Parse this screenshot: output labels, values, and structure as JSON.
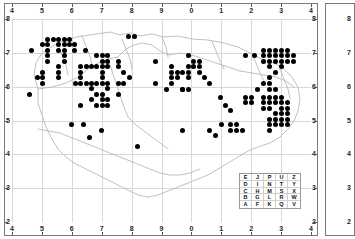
{
  "chart_data": {
    "type": "scatter",
    "title": "",
    "subtitle": "",
    "xlabel": "",
    "ylabel": "",
    "grid": true,
    "legend_position": "bottom-right",
    "axis": {
      "top_ticks": [
        "4",
        "5",
        "6",
        "7",
        "8",
        "9",
        "0",
        "1",
        "2",
        "3",
        "4"
      ],
      "bottom_ticks": [
        "4",
        "5",
        "6",
        "7",
        "8",
        "9",
        "0",
        "1",
        "2",
        "3",
        "4"
      ],
      "left_ticks": [
        "8",
        "7",
        "6",
        "5",
        "4",
        "3",
        "2"
      ],
      "right_ticks": [
        "8",
        "7",
        "6",
        "5",
        "4",
        "3",
        "2"
      ],
      "xlim": [
        40,
        140
      ],
      "ylim": [
        15,
        85
      ]
    },
    "marker": {
      "shape": "filled-circle",
      "color": "#000000",
      "size_px": 5
    },
    "points": [
      [
        52.0,
        78.1
      ],
      [
        53.8,
        78.1
      ],
      [
        55.6,
        78.1
      ],
      [
        57.4,
        78.1
      ],
      [
        59.2,
        78.1
      ],
      [
        50.2,
        76.2
      ],
      [
        52.0,
        76.2
      ],
      [
        55.6,
        76.2
      ],
      [
        57.4,
        76.2
      ],
      [
        59.2,
        76.2
      ],
      [
        61.0,
        76.2
      ],
      [
        46.6,
        74.3
      ],
      [
        52.0,
        74.3
      ],
      [
        55.6,
        74.3
      ],
      [
        57.4,
        74.3
      ],
      [
        61.0,
        74.3
      ],
      [
        64.6,
        74.3
      ],
      [
        52.0,
        72.4
      ],
      [
        57.4,
        72.4
      ],
      [
        52.0,
        70.5
      ],
      [
        57.4,
        70.5
      ],
      [
        55.6,
        68.6
      ],
      [
        50.2,
        66.7
      ],
      [
        55.6,
        66.7
      ],
      [
        48.4,
        64.8
      ],
      [
        50.2,
        64.8
      ],
      [
        55.6,
        64.8
      ],
      [
        50.2,
        62.9
      ],
      [
        79.0,
        79.0
      ],
      [
        81.0,
        79.0
      ],
      [
        68.4,
        72.4
      ],
      [
        70.2,
        72.4
      ],
      [
        72.0,
        72.4
      ],
      [
        70.2,
        70.5
      ],
      [
        72.0,
        70.5
      ],
      [
        75.6,
        70.5
      ],
      [
        63.0,
        68.6
      ],
      [
        64.8,
        68.6
      ],
      [
        66.6,
        68.6
      ],
      [
        68.4,
        68.6
      ],
      [
        70.2,
        68.6
      ],
      [
        72.0,
        68.6
      ],
      [
        75.6,
        68.6
      ],
      [
        63.0,
        66.7
      ],
      [
        70.2,
        66.7
      ],
      [
        77.4,
        66.7
      ],
      [
        63.0,
        64.8
      ],
      [
        70.2,
        64.8
      ],
      [
        79.2,
        64.8
      ],
      [
        61.2,
        62.9
      ],
      [
        63.0,
        62.9
      ],
      [
        64.8,
        62.9
      ],
      [
        66.6,
        62.9
      ],
      [
        68.4,
        62.9
      ],
      [
        70.2,
        62.9
      ],
      [
        72.0,
        62.9
      ],
      [
        75.6,
        62.9
      ],
      [
        77.4,
        62.9
      ],
      [
        66.6,
        61.0
      ],
      [
        72.0,
        61.0
      ],
      [
        68.4,
        59.1
      ],
      [
        70.2,
        59.1
      ],
      [
        75.6,
        59.1
      ],
      [
        66.6,
        57.2
      ],
      [
        70.2,
        57.2
      ],
      [
        72.0,
        57.2
      ],
      [
        63.0,
        55.3
      ],
      [
        68.4,
        55.3
      ],
      [
        70.2,
        55.3
      ],
      [
        72.0,
        55.3
      ],
      [
        88.0,
        70.5
      ],
      [
        93.4,
        68.6
      ],
      [
        93.4,
        66.7
      ],
      [
        95.2,
        66.7
      ],
      [
        97.0,
        66.7
      ],
      [
        93.4,
        64.8
      ],
      [
        95.2,
        64.8
      ],
      [
        88.0,
        62.9
      ],
      [
        93.4,
        62.9
      ],
      [
        91.6,
        60.6
      ],
      [
        97.0,
        60.6
      ],
      [
        99.0,
        72.4
      ],
      [
        100.8,
        70.5
      ],
      [
        102.6,
        70.5
      ],
      [
        99.0,
        68.6
      ],
      [
        100.8,
        68.6
      ],
      [
        102.6,
        68.6
      ],
      [
        99.0,
        66.7
      ],
      [
        102.6,
        66.7
      ],
      [
        99.0,
        64.8
      ],
      [
        104.4,
        64.8
      ],
      [
        97.0,
        60.6
      ],
      [
        99.0,
        60.6
      ],
      [
        106.0,
        62.9
      ],
      [
        109.6,
        58.0
      ],
      [
        111.4,
        55.3
      ],
      [
        113.2,
        53.4
      ],
      [
        118.0,
        72.4
      ],
      [
        124.0,
        74.3
      ],
      [
        126.0,
        74.3
      ],
      [
        128.0,
        74.3
      ],
      [
        130.0,
        74.3
      ],
      [
        132.0,
        74.3
      ],
      [
        121.0,
        72.4
      ],
      [
        124.0,
        72.4
      ],
      [
        126.0,
        72.4
      ],
      [
        128.0,
        72.4
      ],
      [
        130.0,
        72.4
      ],
      [
        132.0,
        72.4
      ],
      [
        134.0,
        72.4
      ],
      [
        124.0,
        70.5
      ],
      [
        126.0,
        70.5
      ],
      [
        128.0,
        70.5
      ],
      [
        130.0,
        70.5
      ],
      [
        132.0,
        70.5
      ],
      [
        134.0,
        70.5
      ],
      [
        126.0,
        68.6
      ],
      [
        130.0,
        68.6
      ],
      [
        128.0,
        66.7
      ],
      [
        126.0,
        64.8
      ],
      [
        124.0,
        62.9
      ],
      [
        126.0,
        62.9
      ],
      [
        122.0,
        60.6
      ],
      [
        126.0,
        60.6
      ],
      [
        128.0,
        60.6
      ],
      [
        118.0,
        58.0
      ],
      [
        120.0,
        58.0
      ],
      [
        124.0,
        58.0
      ],
      [
        126.0,
        58.0
      ],
      [
        128.0,
        58.0
      ],
      [
        130.0,
        58.0
      ],
      [
        118.0,
        56.1
      ],
      [
        120.0,
        56.1
      ],
      [
        124.0,
        56.1
      ],
      [
        126.0,
        56.1
      ],
      [
        128.0,
        56.1
      ],
      [
        130.0,
        56.1
      ],
      [
        132.0,
        56.1
      ],
      [
        124.0,
        54.2
      ],
      [
        126.0,
        54.2
      ],
      [
        130.0,
        54.2
      ],
      [
        132.0,
        54.2
      ],
      [
        128.0,
        52.3
      ],
      [
        130.0,
        52.3
      ],
      [
        132.0,
        52.3
      ],
      [
        126.0,
        50.4
      ],
      [
        128.0,
        50.4
      ],
      [
        130.0,
        50.4
      ],
      [
        132.0,
        50.4
      ],
      [
        126.0,
        48.5
      ],
      [
        128.0,
        48.5
      ],
      [
        130.0,
        48.5
      ],
      [
        132.0,
        48.5
      ],
      [
        126.0,
        46.6
      ],
      [
        110.0,
        48.5
      ],
      [
        113.0,
        48.5
      ],
      [
        115.0,
        48.5
      ],
      [
        106.0,
        46.6
      ],
      [
        113.0,
        46.6
      ],
      [
        115.0,
        46.6
      ],
      [
        117.0,
        46.6
      ],
      [
        108.0,
        44.7
      ],
      [
        60.0,
        48.5
      ],
      [
        64.0,
        48.5
      ],
      [
        70.0,
        46.6
      ],
      [
        66.0,
        44.0
      ],
      [
        82.0,
        41.0
      ],
      [
        97.0,
        46.6
      ],
      [
        46.0,
        59.1
      ]
    ],
    "legend": {
      "rows": [
        [
          "E",
          "J",
          "P",
          "U",
          "Z"
        ],
        [
          "D",
          "I",
          "N",
          "T",
          "Y"
        ],
        [
          "C",
          "H",
          "M",
          "S",
          "X"
        ],
        [
          "B",
          "G",
          "L",
          "R",
          "W"
        ],
        [
          "A",
          "F",
          "K",
          "Q",
          "V"
        ]
      ]
    },
    "colors": {
      "frame": "#7a7a7a",
      "grid": "#d8d8d8",
      "coast": "#b5b5b5",
      "marker": "#000000",
      "tick_text": "#262626",
      "background": "#ffffff"
    }
  },
  "side_panel": {
    "ticks": [
      "8",
      "7",
      "6",
      "5",
      "4",
      "3",
      "2"
    ]
  }
}
